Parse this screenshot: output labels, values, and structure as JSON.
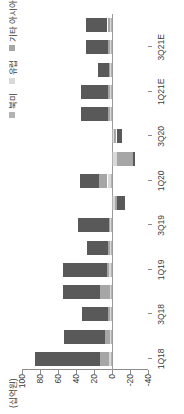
{
  "chart": {
    "type": "bar",
    "unit_label": "(십억원)",
    "orientation": "rotated-90ccw"
  },
  "legend": {
    "items": [
      {
        "label": "북미",
        "color": "#b3b3b3"
      },
      {
        "label": "유럽",
        "color": "#d9d9d9"
      },
      {
        "label": "기타 아시아",
        "color": "#a6a6a6"
      },
      {
        "label": "중국",
        "color": "#595959"
      }
    ]
  },
  "axes": {
    "y": {
      "ticks": [
        100,
        80,
        60,
        40,
        20,
        0,
        -20,
        -40
      ],
      "min": -40,
      "max": 100
    },
    "x": {
      "tick_labels": [
        "1Q18",
        "3Q18",
        "1Q19",
        "3Q19",
        "1Q20",
        "3Q20",
        "1Q21E",
        "3Q21E"
      ]
    }
  },
  "chart_data": {
    "type": "bar",
    "title": "",
    "xlabel": "",
    "ylabel": "(십억원)",
    "ylim": [
      -40,
      100
    ],
    "grid": false,
    "legend_position": "top-right",
    "stacked": true,
    "categories": [
      "1Q18",
      "2Q18",
      "3Q18",
      "4Q18",
      "1Q19",
      "2Q19",
      "3Q19",
      "4Q19",
      "1Q20",
      "2Q20",
      "3Q20",
      "4Q20",
      "1Q21E",
      "2Q21E",
      "3Q21E",
      "4Q21E"
    ],
    "series": [
      {
        "name": "중국",
        "color": "#595959",
        "values": [
          73,
          45,
          29,
          41,
          49,
          24,
          35,
          -8,
          22,
          -3,
          -6,
          30,
          31,
          13,
          25,
          24
        ]
      },
      {
        "name": "기타 아시아",
        "color": "#a6a6a6",
        "values": [
          10,
          6,
          2,
          11,
          3,
          2,
          1,
          -3,
          9,
          -17,
          -3,
          2,
          2,
          1,
          2,
          3
        ]
      },
      {
        "name": "유럽",
        "color": "#d9d9d9",
        "values": [
          2,
          1,
          1,
          1,
          2,
          1,
          1,
          -2,
          4,
          -5,
          -1,
          1,
          1,
          1,
          1,
          1
        ]
      },
      {
        "name": "북미",
        "color": "#b3b3b3",
        "values": [
          1,
          1,
          1,
          1,
          1,
          1,
          1,
          -1,
          1,
          -1,
          -1,
          1,
          1,
          1,
          1,
          1
        ]
      }
    ]
  }
}
